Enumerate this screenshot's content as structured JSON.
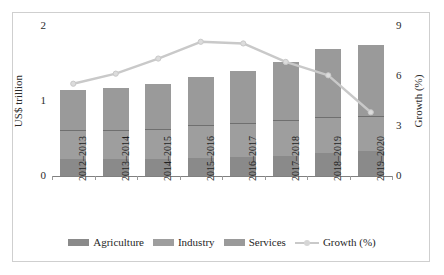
{
  "chart": {
    "type": "combo",
    "axis_left": {
      "title": "US$ trillion",
      "ticks": [
        "0",
        "1",
        "2"
      ],
      "min": 0,
      "max": 2
    },
    "axis_right": {
      "title": "Growth (%)",
      "ticks": [
        "0",
        "3",
        "6",
        "9"
      ],
      "min": 0,
      "max": 9
    }
  },
  "legend": {
    "items": [
      {
        "label": "Agriculture",
        "color": "#8a8a8a",
        "kind": "bar"
      },
      {
        "label": "Industry",
        "color": "#9e9e9e",
        "kind": "bar"
      },
      {
        "label": "Services",
        "color": "#9a9a9a",
        "kind": "bar"
      },
      {
        "label": "Growth (%)",
        "color": "#c9c9c9",
        "kind": "line"
      }
    ]
  },
  "chart_data": {
    "type": "bar",
    "title": "",
    "xlabel": "",
    "ylabel": "US$ trillion",
    "y2label": "Growth (%)",
    "ylim": [
      0,
      2
    ],
    "y2lim": [
      0,
      9
    ],
    "grid": false,
    "legend_position": "bottom",
    "stacked": true,
    "categories": [
      "2012–2013",
      "2013–2014",
      "2014–2015",
      "2015–2016",
      "2016–2017",
      "2017–2018",
      "2018–2019",
      "2019–2020"
    ],
    "series": [
      {
        "name": "Agriculture",
        "axis": "left",
        "color": "#8a8a8a",
        "values": [
          0.22,
          0.22,
          0.22,
          0.24,
          0.25,
          0.26,
          0.3,
          0.33
        ]
      },
      {
        "name": "Industry",
        "axis": "left",
        "color": "#9e9e9e",
        "values": [
          0.37,
          0.38,
          0.39,
          0.42,
          0.44,
          0.47,
          0.47,
          0.45
        ]
      },
      {
        "name": "Services",
        "axis": "left",
        "color": "#9a9a9a",
        "values": [
          0.53,
          0.55,
          0.6,
          0.64,
          0.69,
          0.77,
          0.9,
          0.94
        ]
      },
      {
        "name": "Growth (%)",
        "axis": "right",
        "color": "#c9c9c9",
        "type": "line",
        "values": [
          5.5,
          6.1,
          7.0,
          8.0,
          7.9,
          6.8,
          6.0,
          3.8
        ]
      }
    ],
    "totals": [
      1.12,
      1.15,
      1.21,
      1.3,
      1.38,
      1.5,
      1.67,
      1.72
    ]
  }
}
